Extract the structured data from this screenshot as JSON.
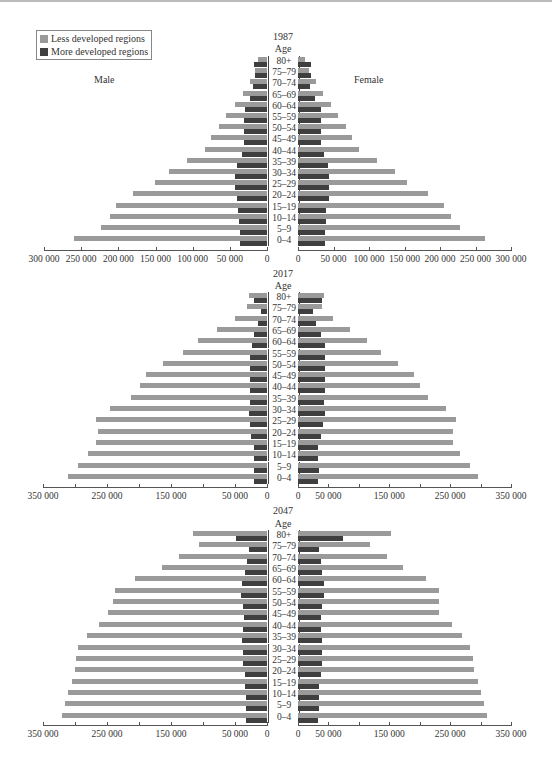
{
  "chart_data": [
    {
      "type": "bar",
      "subtype": "population-pyramid",
      "title": "1987",
      "age_label": "Age",
      "left_label": "Male",
      "right_label": "Female",
      "units": "persons",
      "categories": [
        "80+",
        "75–79",
        "70–74",
        "65–69",
        "60–64",
        "55–59",
        "50–54",
        "45–49",
        "40–44",
        "35–39",
        "30–34",
        "25–29",
        "20–24",
        "15–19",
        "10–14",
        "5–9",
        "0–4"
      ],
      "series": [
        {
          "name": "Male - Less developed regions",
          "values": [
            12000,
            16000,
            23000,
            32000,
            43000,
            55000,
            65000,
            75000,
            84000,
            108000,
            132000,
            151000,
            180000,
            203000,
            211000,
            223000,
            259000
          ]
        },
        {
          "name": "Male - More developed regions",
          "values": [
            17000,
            16000,
            19000,
            23000,
            29000,
            31000,
            31000,
            31000,
            33000,
            40000,
            43000,
            43000,
            40000,
            39000,
            38000,
            36000,
            36000
          ]
        },
        {
          "name": "Female - Less developed regions",
          "values": [
            10000,
            15000,
            25000,
            35000,
            46000,
            57000,
            68000,
            76000,
            86000,
            111000,
            136000,
            154000,
            183000,
            206000,
            215000,
            228000,
            264000
          ]
        },
        {
          "name": "Female - More developed regions",
          "values": [
            19000,
            18000,
            17000,
            24000,
            32000,
            32000,
            32000,
            33000,
            36000,
            42000,
            43000,
            44000,
            43000,
            40000,
            39000,
            38000,
            38000
          ]
        }
      ],
      "x_ticks": [
        "300 000",
        "250 000",
        "200 000",
        "150 000",
        "100 000",
        "50 000",
        "0",
        "0",
        "50 000",
        "100 000",
        "150 000",
        "200 000",
        "250 000",
        "300 000"
      ],
      "xlim": [
        0,
        300000
      ],
      "grid": false
    },
    {
      "type": "bar",
      "subtype": "population-pyramid",
      "title": "2017",
      "age_label": "Age",
      "categories": [
        "80+",
        "75–79",
        "70–74",
        "65–69",
        "60–64",
        "55–59",
        "50–54",
        "45–49",
        "40–44",
        "35–39",
        "30–34",
        "25–29",
        "20–24",
        "15–19",
        "10–14",
        "5–9",
        "0–4"
      ],
      "series": [
        {
          "name": "Male - Less developed regions",
          "values": [
            28000,
            31000,
            50000,
            78000,
            108000,
            131000,
            162000,
            189000,
            198000,
            212000,
            245000,
            267000,
            264000,
            267000,
            280000,
            295000,
            311000
          ]
        },
        {
          "name": "Male - More developed regions",
          "values": [
            20000,
            10000,
            14000,
            20000,
            23000,
            26000,
            27000,
            27000,
            27000,
            27000,
            28000,
            27000,
            25000,
            21000,
            20000,
            21000,
            20000
          ]
        },
        {
          "name": "Female - Less developed regions",
          "values": [
            42000,
            40000,
            57000,
            85000,
            113000,
            136000,
            165000,
            190000,
            200000,
            213000,
            243000,
            260000,
            254000,
            255000,
            267000,
            282000,
            296000
          ]
        },
        {
          "name": "Female - More developed regions",
          "values": [
            40000,
            25000,
            30000,
            38000,
            44000,
            45000,
            45000,
            44000,
            44000,
            43000,
            44000,
            41000,
            37000,
            33000,
            33000,
            34000,
            33000
          ]
        }
      ],
      "x_ticks": [
        "350 000",
        "250 000",
        "150 000",
        "50 000",
        "0",
        "0",
        "50 000",
        "150 000",
        "250 000",
        "350 000"
      ],
      "xlim": [
        0,
        350000
      ],
      "grid": false
    },
    {
      "type": "bar",
      "subtype": "population-pyramid",
      "title": "2047",
      "age_label": "Age",
      "categories": [
        "80+",
        "75–79",
        "70–74",
        "65–69",
        "60–64",
        "55–59",
        "50–54",
        "45–49",
        "40–44",
        "35–39",
        "30–34",
        "25–29",
        "20–24",
        "15–19",
        "10–14",
        "5–9",
        "0–4"
      ],
      "series": [
        {
          "name": "Male - Less developed regions",
          "values": [
            115000,
            107000,
            137000,
            164000,
            206000,
            237000,
            241000,
            248000,
            263000,
            282000,
            295000,
            299000,
            300000,
            304000,
            311000,
            316000,
            321000
          ]
        },
        {
          "name": "Male - More developed regions",
          "values": [
            49000,
            28000,
            32000,
            35000,
            39000,
            40000,
            38000,
            36000,
            37000,
            39000,
            38000,
            37000,
            35000,
            34000,
            33000,
            33000,
            33000
          ]
        },
        {
          "name": "Female - Less developed regions",
          "values": [
            152000,
            118000,
            146000,
            172000,
            210000,
            232000,
            231000,
            232000,
            253000,
            270000,
            283000,
            287000,
            290000,
            295000,
            301000,
            306000,
            311000
          ]
        },
        {
          "name": "Female - More developed regions",
          "values": [
            74000,
            35000,
            38000,
            40000,
            43000,
            42000,
            39000,
            37000,
            38000,
            40000,
            40000,
            39000,
            37000,
            35000,
            34000,
            34000,
            33000
          ]
        }
      ],
      "x_ticks": [
        "350 000",
        "250 000",
        "150 000",
        "50 000",
        "0",
        "0",
        "50 000",
        "150 000",
        "250 000",
        "350 000"
      ],
      "xlim": [
        0,
        350000
      ],
      "grid": false
    }
  ],
  "legend": {
    "items": [
      {
        "label": "Less developed regions",
        "color": "#9a9a9a"
      },
      {
        "label": "More developed regions",
        "color": "#3f3f3f"
      }
    ],
    "position": "top-left"
  },
  "colors": {
    "less": "#9a9a9a",
    "more": "#3f3f3f",
    "axis": "#555555"
  }
}
